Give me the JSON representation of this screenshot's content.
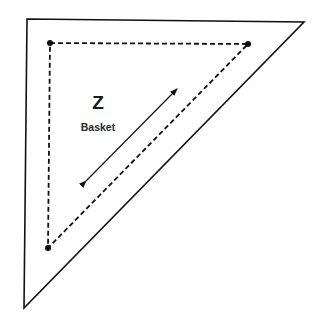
{
  "diagram": {
    "type": "quilt-template-piece",
    "piece_letter": "Z",
    "piece_name": "Basket",
    "shape": "right-triangle",
    "outer_cut_line": {
      "points": [
        [
          27,
          19
        ],
        [
          304,
          22
        ],
        [
          24,
          308
        ]
      ],
      "style": "solid"
    },
    "inner_seam_line": {
      "points": [
        [
          50,
          43
        ],
        [
          248,
          44
        ],
        [
          48,
          248
        ]
      ],
      "style": "dashed",
      "corner_dots": true
    },
    "grain_arrow": {
      "from": [
        84,
        183
      ],
      "to": [
        178,
        88
      ],
      "double_headed": true
    },
    "colors": {
      "line": "#111111",
      "background": "#ffffff"
    }
  }
}
